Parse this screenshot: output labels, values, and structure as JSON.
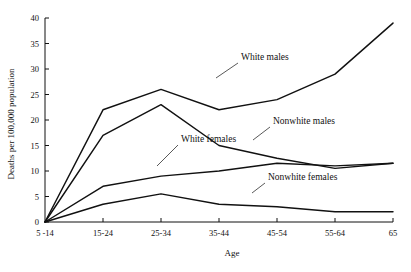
{
  "chart_data": {
    "type": "line",
    "title": "",
    "xlabel": "Age",
    "ylabel": "Deaths per 100,000 population",
    "categories": [
      "5 -14",
      "15-24",
      "25-34",
      "35-44",
      "45-54",
      "55-64",
      "65"
    ],
    "ylim": [
      0,
      40
    ],
    "yticks": [
      "0",
      "5",
      "10",
      "15",
      "20",
      "25",
      "30",
      "35",
      "40"
    ],
    "ytick_values": [
      0,
      5,
      10,
      15,
      20,
      25,
      30,
      35,
      40
    ],
    "grid": false,
    "legend_position": "inline-annotations",
    "series": [
      {
        "name": "White males",
        "values": [
          0,
          22,
          26,
          22,
          24,
          29,
          39
        ]
      },
      {
        "name": "Nonwhite males",
        "values": [
          0,
          17,
          23,
          15,
          12.5,
          10.5,
          11.5
        ]
      },
      {
        "name": "White females",
        "values": [
          0,
          7,
          9,
          10,
          11.5,
          11,
          11.5
        ]
      },
      {
        "name": "Nonwhite females",
        "values": [
          0,
          3.5,
          5.5,
          3.5,
          3,
          2,
          2
        ]
      }
    ],
    "annotations": [
      {
        "text": "White males",
        "x": 241,
        "y": 60,
        "leader": "M238,63 L216,78"
      },
      {
        "text": "Nonwhite males",
        "x": 273,
        "y": 124,
        "leader": "M270,127 L253,140"
      },
      {
        "text": "White females",
        "x": 181,
        "y": 142,
        "leader": "M178,145 L157,166"
      },
      {
        "text": "Nonwhite females",
        "x": 268,
        "y": 180,
        "leader": "M265,183 L252,193"
      }
    ]
  },
  "axis": {
    "y_title": "Deaths per 100,000 population",
    "x_title": "Age"
  }
}
